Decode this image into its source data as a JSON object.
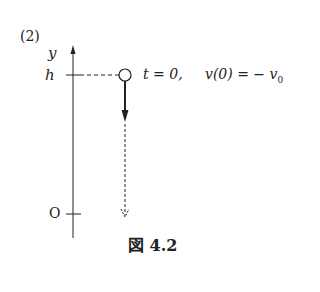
{
  "problem_label": "(2)",
  "axis": {
    "name": "y",
    "top_label": "h",
    "origin_label": "O"
  },
  "annotation": {
    "time": "t = 0,",
    "velocity": "v(0) = − v",
    "velocity_sub": "0"
  },
  "caption": {
    "prefix": "図",
    "number": "4.2"
  },
  "colors": {
    "ink": "#222222"
  }
}
